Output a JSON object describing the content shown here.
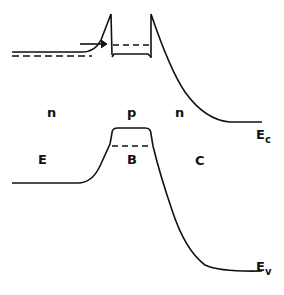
{
  "diagram": {
    "regions": [
      {
        "type_label": "n",
        "region_label": "E"
      },
      {
        "type_label": "p",
        "region_label": "B"
      },
      {
        "type_label": "n",
        "region_label": "C"
      }
    ],
    "band_labels": {
      "conduction": {
        "main": "E",
        "sub": "c"
      },
      "valence": {
        "main": "E",
        "sub": "v"
      }
    },
    "colors": {
      "line": "#111111",
      "background": "#ffffff"
    }
  }
}
